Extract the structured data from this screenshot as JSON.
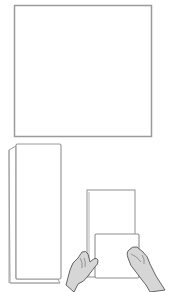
{
  "illustration": {
    "description": "Paper folding instructions: square sheet, folded strip, hands holding folded sheet",
    "colors": {
      "background": "#ffffff",
      "outline": "#8a8a8a",
      "shadow": "#b5b5b5",
      "paper": "#ffffff",
      "hand_fill": "#d9d9d9",
      "hand_line": "#555555"
    },
    "steps": [
      {
        "name": "square-sheet"
      },
      {
        "name": "folded-strip"
      },
      {
        "name": "hands-folding-sheet"
      }
    ]
  }
}
